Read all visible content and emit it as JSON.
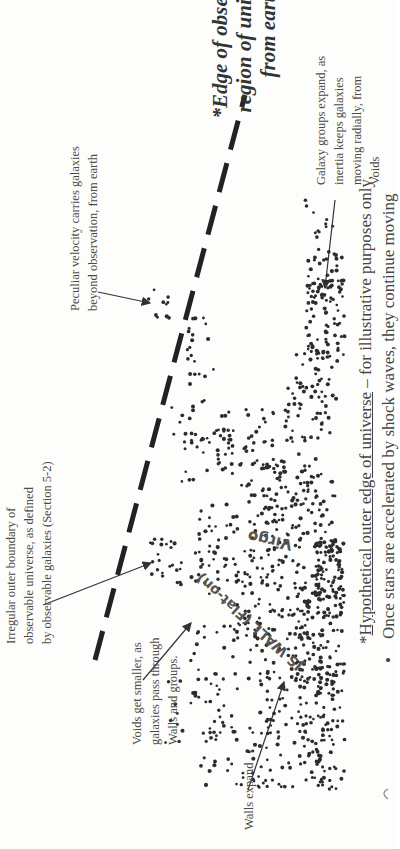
{
  "title": "*Edge of observable\nregion of universe,\nfrom earth",
  "annotations": {
    "galaxy_groups": "Galaxy groups expand, as\ninertia keeps galaxies\nmoving  radially, from\nVoids",
    "peculiar_velocity": "Peculiar velocity carries galaxies\nbeyond observation, from earth",
    "irregular_boundary": "Irregular outer boundary of\nobservable universe, as defined\nby observable galaxies (Section 5-2)",
    "voids_smaller": "Voids get smaller, as\ngalaxies pass through\nWalls and groups.",
    "walls_expand": "Walls expand"
  },
  "structure_labels": {
    "virgo": "Virgo",
    "wall": "JS WALL  (Flat-on)"
  },
  "footnote": {
    "prefix": "*",
    "underlined": "Hypothetical outer edge of universe",
    "rest": " – for illustrative purposes only."
  },
  "bullet": {
    "marker": "•",
    "text": "Once stars are accelerated by shock waves, they continue moving"
  },
  "colors": {
    "ink": "#333333",
    "text": "#4a4a4a",
    "background": "#fdfdfc"
  }
}
